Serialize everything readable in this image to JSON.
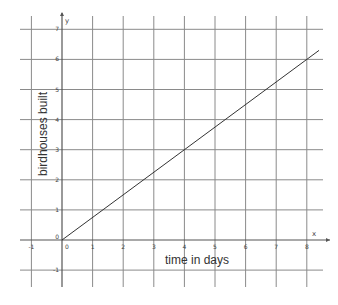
{
  "chart_data": {
    "type": "line",
    "title": "",
    "xlabel": "time in days",
    "ylabel": "birdhouses built",
    "x_axis_name": "x",
    "y_axis_name": "y",
    "xlim": [
      -1,
      8.3
    ],
    "ylim": [
      -1,
      7
    ],
    "x_ticks": [
      -1,
      0,
      1,
      2,
      3,
      4,
      5,
      6,
      7,
      8
    ],
    "y_ticks": [
      -1,
      0,
      1,
      2,
      3,
      4,
      5,
      6,
      7
    ],
    "grid": true,
    "series": [
      {
        "name": "birdhouses built",
        "equation": "y = 0.75x",
        "x": [
          0,
          8.4
        ],
        "y": [
          0,
          6.3
        ]
      }
    ]
  }
}
